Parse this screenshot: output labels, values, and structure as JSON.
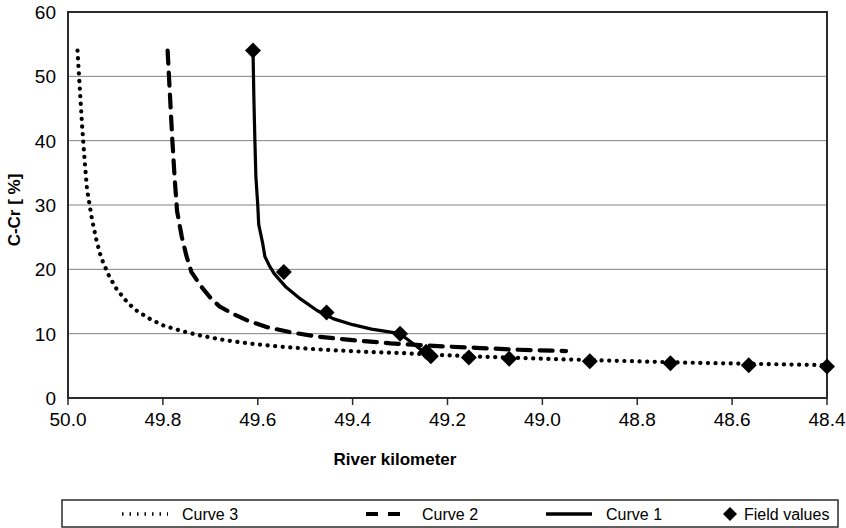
{
  "chart_data": {
    "type": "line",
    "title": "",
    "xlabel": "River kilometer",
    "ylabel": "C-Cr [ %]",
    "xlim": [
      50.0,
      48.4
    ],
    "ylim": [
      0,
      60
    ],
    "x_ticks": [
      "50.0",
      "49.8",
      "49.6",
      "49.4",
      "49.2",
      "49.0",
      "48.8",
      "48.6",
      "48.4"
    ],
    "x_tick_values": [
      50.0,
      49.8,
      49.6,
      49.4,
      49.2,
      49.0,
      48.8,
      48.6,
      48.4
    ],
    "y_ticks": [
      "0",
      "10",
      "20",
      "30",
      "40",
      "50",
      "60"
    ],
    "y_tick_values": [
      0,
      10,
      20,
      30,
      40,
      50,
      60
    ],
    "grid": "horizontal",
    "x_axis_inverted": true,
    "legend_position": "below-plot",
    "series": [
      {
        "name": "Curve 3",
        "style": "dotted",
        "color": "#000000",
        "points": [
          [
            49.98,
            54.0
          ],
          [
            49.975,
            48.0
          ],
          [
            49.97,
            42.0
          ],
          [
            49.965,
            37.0
          ],
          [
            49.96,
            32.5
          ],
          [
            49.95,
            28.0
          ],
          [
            49.94,
            24.5
          ],
          [
            49.93,
            21.8
          ],
          [
            49.915,
            19.2
          ],
          [
            49.9,
            17.2
          ],
          [
            49.88,
            15.3
          ],
          [
            49.86,
            13.8
          ],
          [
            49.83,
            12.4
          ],
          [
            49.8,
            11.3
          ],
          [
            49.76,
            10.4
          ],
          [
            49.72,
            9.7
          ],
          [
            49.67,
            9.0
          ],
          [
            49.61,
            8.4
          ],
          [
            49.54,
            7.9
          ],
          [
            49.46,
            7.5
          ],
          [
            49.38,
            7.2
          ],
          [
            49.3,
            7.0
          ],
          [
            49.22,
            6.7
          ],
          [
            49.12,
            6.4
          ],
          [
            49.0,
            6.1
          ],
          [
            48.85,
            5.8
          ],
          [
            48.7,
            5.5
          ],
          [
            48.55,
            5.3
          ],
          [
            48.4,
            5.1
          ]
        ]
      },
      {
        "name": "Curve 2",
        "style": "dashed",
        "color": "#000000",
        "points": [
          [
            49.79,
            54.0
          ],
          [
            49.785,
            47.0
          ],
          [
            49.78,
            40.0
          ],
          [
            49.775,
            34.0
          ],
          [
            49.77,
            29.0
          ],
          [
            49.76,
            25.0
          ],
          [
            49.75,
            22.0
          ],
          [
            49.74,
            19.6
          ],
          [
            49.72,
            17.4
          ],
          [
            49.7,
            15.6
          ],
          [
            49.68,
            14.2
          ],
          [
            49.65,
            13.0
          ],
          [
            49.62,
            12.0
          ],
          [
            49.58,
            11.0
          ],
          [
            49.53,
            10.2
          ],
          [
            49.47,
            9.5
          ],
          [
            49.4,
            9.0
          ],
          [
            49.32,
            8.5
          ],
          [
            49.23,
            8.1
          ],
          [
            49.14,
            7.8
          ],
          [
            49.05,
            7.5
          ],
          [
            48.95,
            7.3
          ]
        ]
      },
      {
        "name": "Curve 1",
        "style": "solid",
        "color": "#000000",
        "points": [
          [
            49.61,
            54.0
          ],
          [
            49.608,
            46.0
          ],
          [
            49.606,
            40.0
          ],
          [
            49.604,
            34.5
          ],
          [
            49.6,
            30.0
          ],
          [
            49.598,
            27.0
          ],
          [
            49.59,
            24.2
          ],
          [
            49.585,
            22.0
          ],
          [
            49.575,
            20.5
          ],
          [
            49.565,
            19.3
          ],
          [
            49.54,
            17.2
          ],
          [
            49.51,
            15.4
          ],
          [
            49.475,
            13.6
          ],
          [
            49.44,
            12.3
          ],
          [
            49.4,
            11.4
          ],
          [
            49.36,
            10.7
          ],
          [
            49.3,
            10.0
          ],
          [
            49.25,
            7.2
          ],
          [
            49.23,
            7.0
          ]
        ]
      },
      {
        "name": "Field values",
        "style": "markers",
        "marker": "diamond",
        "color": "#000000",
        "points": [
          [
            49.61,
            54.0
          ],
          [
            49.545,
            19.6
          ],
          [
            49.455,
            13.3
          ],
          [
            49.3,
            10.0
          ],
          [
            49.245,
            7.2
          ],
          [
            49.235,
            6.5
          ],
          [
            49.155,
            6.3
          ],
          [
            49.07,
            6.1
          ],
          [
            48.9,
            5.7
          ],
          [
            48.73,
            5.4
          ],
          [
            48.565,
            5.1
          ],
          [
            48.4,
            4.9
          ]
        ]
      }
    ]
  },
  "legend": {
    "entries": [
      {
        "label": "Curve 3",
        "style": "dotted"
      },
      {
        "label": "Curve 2",
        "style": "dashed"
      },
      {
        "label": "Curve 1",
        "style": "solid"
      },
      {
        "label": "Field values",
        "style": "marker"
      }
    ]
  }
}
